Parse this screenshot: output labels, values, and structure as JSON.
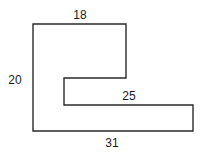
{
  "diagram": {
    "type": "rectilinear-polygon",
    "colors": {
      "stroke": "#2a2a2a",
      "label": "#1a1a1a",
      "background": "#ffffff"
    },
    "points": "33,24 126,24 126,78 64,78 64,105 193,105 193,131 33,131",
    "labels": {
      "top": "18",
      "left": "20",
      "inner_horizontal": "25",
      "bottom": "31"
    }
  }
}
